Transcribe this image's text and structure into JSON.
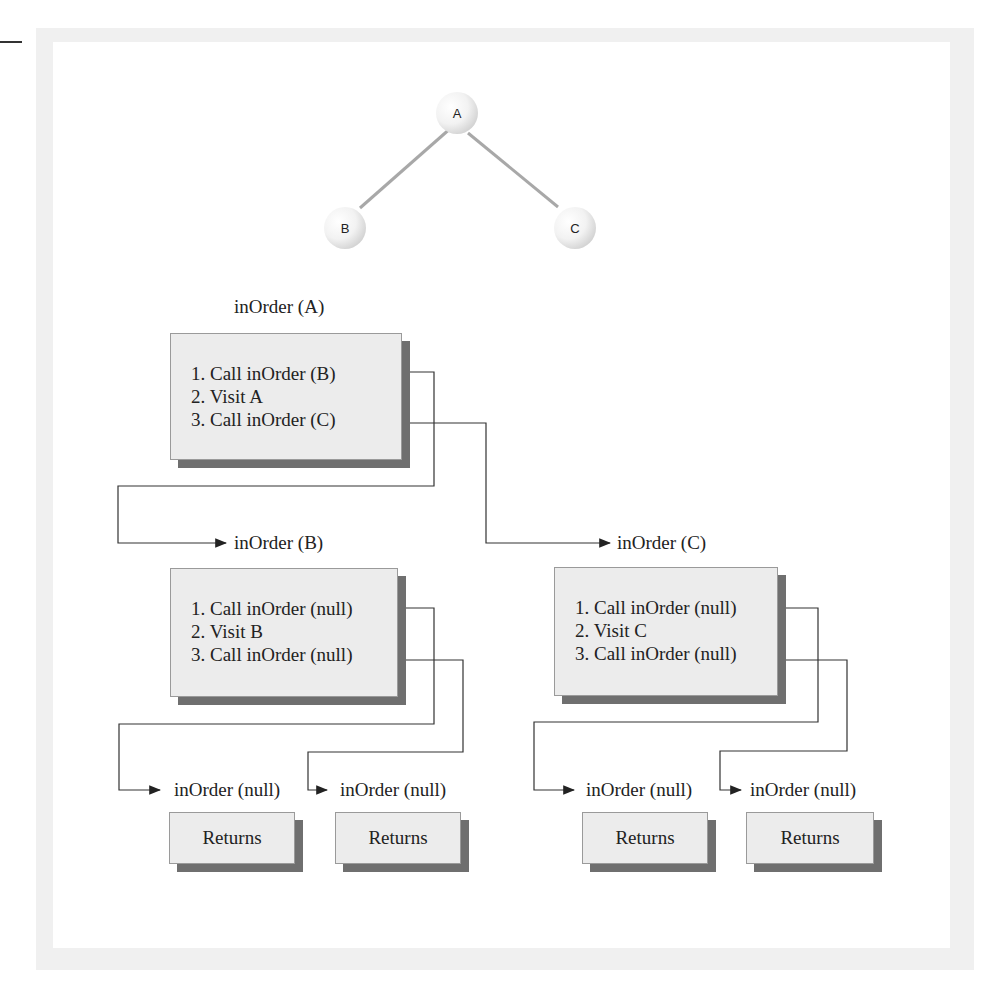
{
  "tree": {
    "nodes": [
      {
        "id": "A",
        "label": "A"
      },
      {
        "id": "B",
        "label": "B"
      },
      {
        "id": "C",
        "label": "C"
      }
    ],
    "edges": [
      [
        "A",
        "B"
      ],
      [
        "A",
        "C"
      ]
    ]
  },
  "calls": {
    "a": {
      "title": "inOrder (A)",
      "steps": [
        "1. Call inOrder (B)",
        "2. Visit A",
        "3. Call inOrder (C)"
      ]
    },
    "b": {
      "title": "inOrder (B)",
      "steps": [
        "1. Call inOrder (null)",
        "2. Visit B",
        "3. Call inOrder (null)"
      ]
    },
    "c": {
      "title": "inOrder (C)",
      "steps": [
        "1. Call inOrder (null)",
        "2. Visit C",
        "3. Call inOrder (null)"
      ]
    },
    "nulls": [
      {
        "title": "inOrder (null)",
        "body": "Returns"
      },
      {
        "title": "inOrder (null)",
        "body": "Returns"
      },
      {
        "title": "inOrder (null)",
        "body": "Returns"
      },
      {
        "title": "inOrder (null)",
        "body": "Returns"
      }
    ]
  }
}
